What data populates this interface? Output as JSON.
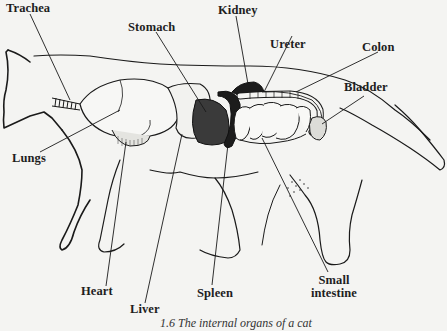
{
  "diagram": {
    "labels": {
      "trachea": "Trachea",
      "stomach": "Stomach",
      "kidney": "Kidney",
      "ureter": "Ureter",
      "colon": "Colon",
      "bladder": "Bladder",
      "lungs": "Lungs",
      "heart": "Heart",
      "liver": "Liver",
      "spleen": "Spleen",
      "small_intestine_line1": "Small",
      "small_intestine_line2": "intestine"
    },
    "caption": "1.6  The internal organs of a cat"
  },
  "colors": {
    "background": "#f4f4f2",
    "ink": "#1a1a1a",
    "dark_organ": "#222222"
  }
}
